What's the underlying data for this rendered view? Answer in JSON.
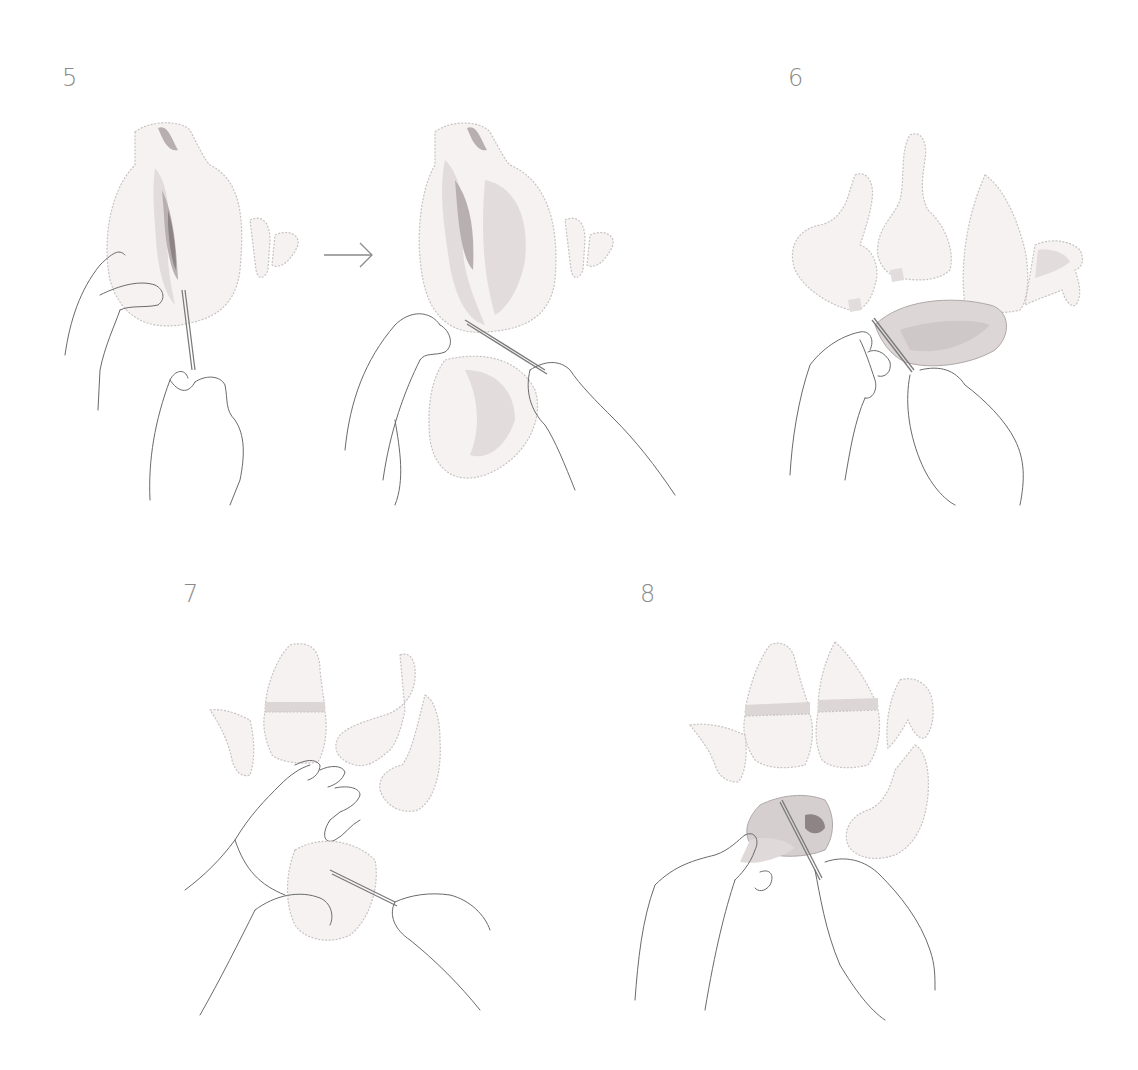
{
  "steps": [
    {
      "number": "5",
      "description": "Cut along the breastbone and separate the breast meat from the carcass"
    },
    {
      "number": "6",
      "description": "Remove the breast fillet with the knife; legs and wings already separated"
    },
    {
      "number": "7",
      "description": "Hold the breast flat and slice it horizontally"
    },
    {
      "number": "8",
      "description": "Trim and cut the breast portion; quartered pieces laid out above"
    }
  ],
  "icons": {
    "arrow": "arrow-right-icon"
  },
  "colors": {
    "line": "#6a6a6a",
    "meat_fill": "#f6f2f2",
    "meat_shade": "#e2dcdc",
    "step_number": "#8a8a8a"
  }
}
